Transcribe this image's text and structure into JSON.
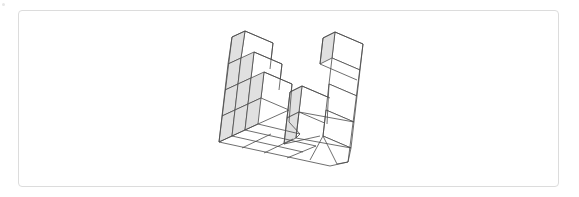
{
  "figure": {
    "stroke": "#4a4a4a",
    "shade": "#e0e0e0",
    "face": "#ffffff",
    "shaded_faces": [
      [
        [
          232,
          37
        ],
        [
          245,
          31
        ],
        [
          241,
          58
        ],
        [
          228,
          64
        ]
      ],
      [
        [
          228,
          64
        ],
        [
          241,
          58
        ],
        [
          238,
          84
        ],
        [
          225,
          90
        ]
      ],
      [
        [
          225,
          90
        ],
        [
          238,
          84
        ],
        [
          235,
          110
        ],
        [
          222,
          116
        ]
      ],
      [
        [
          222,
          116
        ],
        [
          235,
          110
        ],
        [
          232,
          136
        ],
        [
          219,
          142
        ]
      ],
      [
        [
          241,
          58
        ],
        [
          254,
          52
        ],
        [
          251,
          78
        ],
        [
          238,
          84
        ]
      ],
      [
        [
          238,
          84
        ],
        [
          251,
          78
        ],
        [
          248,
          104
        ],
        [
          235,
          110
        ]
      ],
      [
        [
          235,
          110
        ],
        [
          248,
          104
        ],
        [
          245,
          130
        ],
        [
          232,
          136
        ]
      ],
      [
        [
          251,
          78
        ],
        [
          264,
          72
        ],
        [
          261,
          98
        ],
        [
          248,
          104
        ]
      ],
      [
        [
          248,
          104
        ],
        [
          261,
          98
        ],
        [
          258,
          124
        ],
        [
          245,
          130
        ]
      ],
      [
        [
          290,
          92
        ],
        [
          302,
          86
        ],
        [
          299,
          112
        ],
        [
          287,
          118
        ]
      ],
      [
        [
          287,
          118
        ],
        [
          299,
          112
        ],
        [
          296,
          138
        ],
        [
          284,
          144
        ]
      ],
      [
        [
          323,
          38
        ],
        [
          335,
          32
        ],
        [
          332,
          58
        ],
        [
          320,
          64
        ]
      ]
    ],
    "white_faces": [
      [
        [
          245,
          31
        ],
        [
          273,
          43
        ],
        [
          270,
          69
        ],
        [
          241,
          58
        ]
      ],
      [
        [
          254,
          52
        ],
        [
          282,
          64
        ],
        [
          279,
          90
        ],
        [
          251,
          78
        ]
      ],
      [
        [
          264,
          72
        ],
        [
          292,
          84
        ],
        [
          289,
          110
        ],
        [
          261,
          98
        ]
      ],
      [
        [
          302,
          86
        ],
        [
          330,
          98
        ],
        [
          327,
          124
        ],
        [
          299,
          112
        ]
      ],
      [
        [
          335,
          32
        ],
        [
          363,
          44
        ],
        [
          360,
          70
        ],
        [
          332,
          58
        ]
      ],
      [
        [
          332,
          58
        ],
        [
          360,
          70
        ],
        [
          357,
          96
        ],
        [
          329,
          84
        ]
      ],
      [
        [
          329,
          84
        ],
        [
          357,
          96
        ],
        [
          354,
          122
        ],
        [
          326,
          110
        ]
      ],
      [
        [
          326,
          110
        ],
        [
          354,
          122
        ],
        [
          351,
          148
        ],
        [
          323,
          136
        ]
      ],
      [
        [
          323,
          136
        ],
        [
          351,
          148
        ],
        [
          348,
          162
        ],
        [
          337,
          164
        ]
      ]
    ],
    "lines": [
      [
        [
          245,
          31
        ],
        [
          273,
          43
        ]
      ],
      [
        [
          273,
          43
        ],
        [
          270,
          69
        ]
      ],
      [
        [
          232,
          37
        ],
        [
          245,
          31
        ]
      ],
      [
        [
          232,
          37
        ],
        [
          219,
          142
        ]
      ],
      [
        [
          254,
          52
        ],
        [
          282,
          64
        ]
      ],
      [
        [
          282,
          64
        ],
        [
          279,
          90
        ]
      ],
      [
        [
          264,
          72
        ],
        [
          292,
          84
        ]
      ],
      [
        [
          292,
          84
        ],
        [
          289,
          122
        ]
      ],
      [
        [
          302,
          86
        ],
        [
          330,
          98
        ]
      ],
      [
        [
          290,
          92
        ],
        [
          302,
          86
        ]
      ],
      [
        [
          290,
          92
        ],
        [
          284,
          144
        ]
      ],
      [
        [
          323,
          38
        ],
        [
          335,
          32
        ]
      ],
      [
        [
          335,
          32
        ],
        [
          363,
          44
        ]
      ],
      [
        [
          363,
          44
        ],
        [
          348,
          162
        ]
      ],
      [
        [
          323,
          38
        ],
        [
          320,
          64
        ]
      ],
      [
        [
          320,
          64
        ],
        [
          357,
          80
        ]
      ],
      [
        [
          299,
          112
        ],
        [
          354,
          122
        ]
      ],
      [
        [
          296,
          138
        ],
        [
          351,
          148
        ]
      ],
      [
        [
          219,
          142
        ],
        [
          330,
          166
        ]
      ],
      [
        [
          330,
          166
        ],
        [
          348,
          162
        ]
      ],
      [
        [
          232,
          136
        ],
        [
          303,
          152
        ]
      ],
      [
        [
          245,
          130
        ],
        [
          316,
          146
        ]
      ],
      [
        [
          258,
          124
        ],
        [
          300,
          134
        ]
      ],
      [
        [
          219,
          142
        ],
        [
          232,
          136
        ]
      ],
      [
        [
          232,
          136
        ],
        [
          245,
          130
        ]
      ],
      [
        [
          245,
          130
        ],
        [
          258,
          124
        ]
      ],
      [
        [
          258,
          124
        ],
        [
          289,
          110
        ]
      ],
      [
        [
          242,
          148
        ],
        [
          271,
          134
        ]
      ],
      [
        [
          264,
          153
        ],
        [
          293,
          139
        ]
      ],
      [
        [
          287,
          158
        ],
        [
          316,
          146
        ]
      ],
      [
        [
          284,
          144
        ],
        [
          320,
          136
        ]
      ],
      [
        [
          326,
          110
        ],
        [
          323,
          136
        ]
      ],
      [
        [
          329,
          84
        ],
        [
          327,
          124
        ]
      ],
      [
        [
          299,
          112
        ],
        [
          296,
          138
        ]
      ],
      [
        [
          296,
          138
        ],
        [
          300,
          134
        ]
      ],
      [
        [
          289,
          122
        ],
        [
          300,
          134
        ]
      ],
      [
        [
          310,
          160
        ],
        [
          323,
          136
        ]
      ]
    ]
  }
}
